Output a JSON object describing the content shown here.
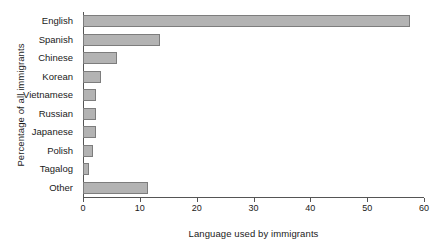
{
  "chart_data": {
    "type": "bar",
    "orientation": "horizontal",
    "title": "",
    "subtitle": "",
    "xlabel": "Language used by immigrants",
    "ylabel": "Percentage of all immigrants",
    "categories": [
      "English",
      "Spanish",
      "Chinese",
      "Korean",
      "Vietnamese",
      "Russian",
      "Japanese",
      "Polish",
      "Tagalog",
      "Other"
    ],
    "values": [
      57.5,
      13.5,
      6.0,
      3.2,
      2.3,
      2.2,
      2.2,
      1.8,
      1.0,
      11.5
    ],
    "xlim": [
      0,
      60
    ],
    "xticks": [
      0,
      10,
      20,
      30,
      40,
      50,
      60
    ],
    "xtick_labels": [
      "0",
      "10",
      "20",
      "30",
      "40",
      "50",
      "60"
    ],
    "grid": false,
    "legend": null,
    "bar_fill_color": "#b3b3b3",
    "bar_border_color": "#7d7d7d",
    "axis_color": "#555555",
    "background_color": "#ffffff",
    "text_color": "#1a1a1a"
  }
}
